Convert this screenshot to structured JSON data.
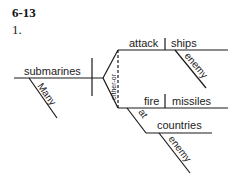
{
  "exercise": {
    "heading": "6-13",
    "item_number": "1."
  },
  "diagram": {
    "subject": "submarines",
    "subject_modifier": "Many",
    "conjunction": "either-or",
    "predicate_upper": {
      "verb": "attack",
      "object": "ships",
      "object_modifier": "enemy"
    },
    "predicate_lower": {
      "verb": "fire",
      "object": "missiles",
      "preposition": "at",
      "prep_object": "countries",
      "prep_object_modifier": "enemy"
    },
    "line_color": "#1a1a1a"
  }
}
